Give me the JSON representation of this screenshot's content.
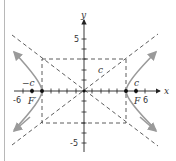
{
  "diagram": {
    "type": "hyperbola",
    "axes": {
      "x_label": "x",
      "y_label": "y",
      "x_ticks": [
        "-6",
        "6"
      ],
      "y_ticks": [
        "5",
        "-5"
      ]
    },
    "labels": {
      "focus_left": "F′",
      "focus_right": "F",
      "c_left": "−c",
      "c_right": "c",
      "c_diag": "c"
    },
    "colors": {
      "curve": "#9a9a9a",
      "axis": "#222222",
      "dashed": "#333333"
    }
  }
}
